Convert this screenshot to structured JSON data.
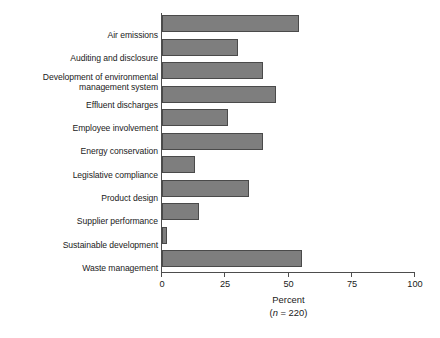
{
  "chart_data": {
    "type": "bar",
    "orientation": "horizontal",
    "title": "",
    "xlabel": "Percent",
    "xlabel_note": "(n = 220)",
    "ylabel": "",
    "xlim": [
      0,
      100
    ],
    "xticks": [
      0,
      25,
      50,
      75,
      100
    ],
    "xtick_labels": [
      "0",
      "25",
      "50",
      "75",
      "100"
    ],
    "grid": false,
    "legend": null,
    "bar_color": "#7e7e7e",
    "bar_edge_color": "#4a4a4a",
    "axis_color": "#4d4d4d",
    "categories": [
      "Air emissions",
      "Auditing and disclosure",
      "Development of environmental\nmanagement system",
      "Effluent discharges",
      "Employee involvement",
      "Energy conservation",
      "Legislative compliance",
      "Product design",
      "Supplier performance",
      "Sustainable development",
      "Waste management"
    ],
    "values": [
      54,
      30,
      40,
      45,
      26,
      40,
      13,
      34.5,
      14.5,
      2,
      55.5
    ]
  }
}
